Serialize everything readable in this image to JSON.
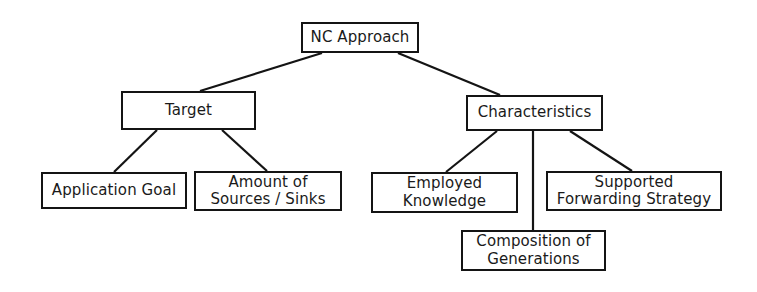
{
  "diagram": {
    "type": "tree",
    "background_color": "#ffffff",
    "line_color": "#141414",
    "box_border_color": "#141414",
    "box_fill_color": "#ffffff",
    "nodes": {
      "root": {
        "label": "NC Approach"
      },
      "target": {
        "label": "Target"
      },
      "characteristics": {
        "label": "Characteristics"
      },
      "application_goal": {
        "label": "Application Goal"
      },
      "amount_sources_sinks": {
        "label": "Amount of\nSources / Sinks"
      },
      "employed_knowledge": {
        "label": "Employed\nKnowledge"
      },
      "supported_forwarding_strategy": {
        "label": "Supported\nForwarding Strategy"
      },
      "composition_generations": {
        "label": "Composition of\nGenerations"
      }
    },
    "edges": [
      {
        "from": "root",
        "to": "target"
      },
      {
        "from": "root",
        "to": "characteristics"
      },
      {
        "from": "target",
        "to": "application_goal"
      },
      {
        "from": "target",
        "to": "amount_sources_sinks"
      },
      {
        "from": "characteristics",
        "to": "employed_knowledge"
      },
      {
        "from": "characteristics",
        "to": "composition_generations"
      },
      {
        "from": "characteristics",
        "to": "supported_forwarding_strategy"
      }
    ]
  }
}
